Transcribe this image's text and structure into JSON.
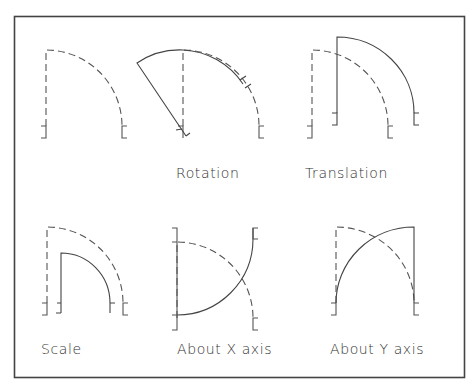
{
  "diagram": {
    "legend": {
      "dashed": "original",
      "solid": "transformed"
    },
    "panels": [
      {
        "id": "original",
        "label": ""
      },
      {
        "id": "rotation",
        "label": "Rotation"
      },
      {
        "id": "translation",
        "label": "Translation"
      },
      {
        "id": "scale",
        "label": "Scale"
      },
      {
        "id": "about-x",
        "label": "About X axis"
      },
      {
        "id": "about-y",
        "label": "About Y axis"
      }
    ],
    "colors": {
      "line": "#444444",
      "background": "#ffffff"
    }
  }
}
